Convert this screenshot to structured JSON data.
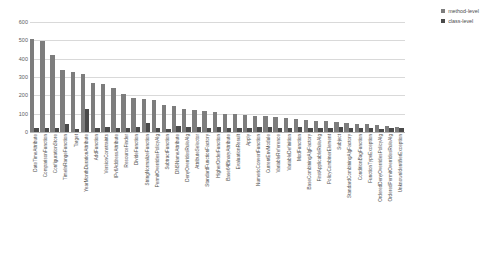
{
  "chart_data": {
    "type": "bar",
    "title": "",
    "xlabel": "",
    "ylabel": "",
    "ylim": [
      0,
      600
    ],
    "yticks": [
      0,
      100,
      200,
      300,
      400,
      500,
      600
    ],
    "grid": true,
    "legend_position": "top-right",
    "colors": {
      "method-level": "#7d7d7d",
      "class-level": "#4a4a4a",
      "gridline": "#d9d9d9",
      "axis": "#b5b5b5",
      "text": "#4d4d4d",
      "background": "#ffffff"
    },
    "categories": [
      "DateTimeAttribute",
      "ComparisonFunction",
      "ConfigurationStore",
      "TimeInRangeFunction",
      "Target",
      "YearMonthDurationAttribute",
      "AddFunction",
      "VersionConstraints",
      "IPv6AddressAttribute",
      "ResourceFinder",
      "DivideFunction",
      "StringNormalizeFunction",
      "PermitOverridesPolicyAlg",
      "SubtractFunction",
      "DNSNameAttribute",
      "DenyOverridesRuleAlg",
      "AttributeSelector",
      "StandardFunctionFactory",
      "HigherOrderFunction",
      "Base64BinaryAttribute",
      "EvaluationResult",
      "Apply",
      "NumericConvertFunction",
      "CurrentEnvModule",
      "VariableReference",
      "VariableDefinition",
      "ModFunction",
      "BaseCombiningAlgFactory",
      "FirstApplicableRuleAlg",
      "PolicyCombinerElement",
      "Subject",
      "StandardCombiningAlgFactory",
      "ConditionBagFunction",
      "FunctionTypeException",
      "OrderedDenyOverridesPolicyAlg",
      "OrderedPermitOverridesRuleAlg",
      "UnknownIdentifierException"
    ],
    "series": [
      {
        "name": "method-level",
        "values": [
          510,
          497,
          420,
          337,
          330,
          318,
          268,
          262,
          238,
          205,
          183,
          178,
          172,
          150,
          140,
          128,
          120,
          113,
          107,
          100,
          98,
          95,
          88,
          85,
          82,
          74,
          70,
          66,
          62,
          58,
          55,
          50,
          46,
          42,
          38,
          32,
          28
        ]
      },
      {
        "name": "class-level",
        "values": [
          22,
          20,
          24,
          44,
          18,
          126,
          20,
          26,
          22,
          20,
          30,
          48,
          22,
          18,
          34,
          30,
          26,
          22,
          28,
          20,
          24,
          22,
          30,
          26,
          22,
          20,
          28,
          24,
          22,
          20,
          26,
          22,
          20,
          24,
          18,
          20,
          22
        ]
      }
    ]
  },
  "legend": {
    "items": [
      {
        "label": "method-level"
      },
      {
        "label": "class-level"
      }
    ]
  }
}
